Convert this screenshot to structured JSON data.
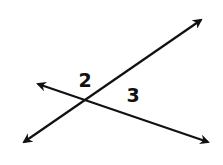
{
  "diagram": {
    "type": "intersecting-lines",
    "stroke_color": "#111111",
    "background": "#ffffff",
    "lines": [
      {
        "id": "line-a",
        "x1": 24,
        "y1": 142,
        "x2": 201,
        "y2": 20,
        "arrows": "both"
      },
      {
        "id": "line-b",
        "x1": 38,
        "y1": 84,
        "x2": 208,
        "y2": 142,
        "arrows": "both"
      }
    ],
    "intersection": {
      "x": 87,
      "y": 100
    },
    "labels": [
      {
        "id": "angle-2",
        "text": "2",
        "x": 85,
        "y": 87
      },
      {
        "id": "angle-3",
        "text": "3",
        "x": 133,
        "y": 102
      }
    ]
  }
}
